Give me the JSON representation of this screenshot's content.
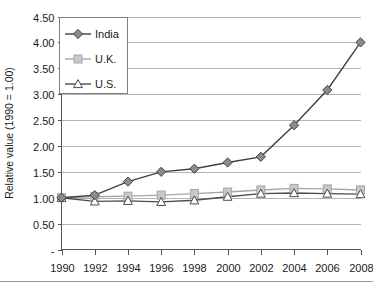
{
  "chart_data": {
    "type": "line",
    "title": "",
    "xlabel": "",
    "ylabel": "Relative value (1990 = 1.00)",
    "x": [
      1990,
      1992,
      1994,
      1996,
      1998,
      2000,
      2002,
      2004,
      2006,
      2008
    ],
    "xtick_labels": [
      "1990",
      "1992",
      "1994",
      "1996",
      "1998",
      "2000",
      "2002",
      "2004",
      "2006",
      "2008"
    ],
    "ytick_labels": [
      "4.50",
      "4.00",
      "3.50",
      "3.00",
      "2.50",
      "2.00",
      "1.50",
      "1.00",
      "0.50",
      "-"
    ],
    "ytick_values": [
      4.5,
      4.0,
      3.5,
      3.0,
      2.5,
      2.0,
      1.5,
      1.0,
      0.5,
      0.0
    ],
    "ylim": [
      0.0,
      4.5
    ],
    "xlim": [
      1990,
      2008
    ],
    "grid": "horizontal",
    "legend_position": "top-left-inside",
    "series": [
      {
        "name": "India",
        "marker": "diamond",
        "color": "#404040",
        "marker_fill": "#8c8c8c",
        "values": [
          1.0,
          1.05,
          1.31,
          1.5,
          1.56,
          1.68,
          1.79,
          2.4,
          3.08,
          4.0
        ]
      },
      {
        "name": "U.K.",
        "marker": "square",
        "color": "#a6a6a6",
        "marker_fill": "#c8c8c8",
        "values": [
          1.0,
          1.02,
          1.03,
          1.05,
          1.08,
          1.11,
          1.15,
          1.18,
          1.17,
          1.15
        ]
      },
      {
        "name": "U.S.",
        "marker": "triangle",
        "color": "#4d4d4d",
        "marker_fill": "#ffffff",
        "values": [
          1.0,
          0.93,
          0.94,
          0.92,
          0.95,
          1.02,
          1.08,
          1.09,
          1.08,
          1.07
        ]
      }
    ]
  },
  "legend": {
    "items": [
      {
        "label": "India"
      },
      {
        "label": "U.K."
      },
      {
        "label": "U.S."
      }
    ]
  }
}
